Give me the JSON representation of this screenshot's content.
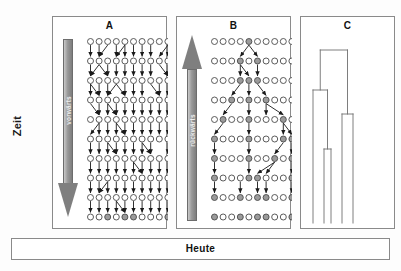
{
  "figure": {
    "time_axis_label": "Zeit",
    "bottom_bar_label": "Heute",
    "background_color": "#ffffff",
    "frame_color": "#8a8a8a"
  },
  "panels": [
    {
      "id": "A",
      "title": "A",
      "direction_label": "vorwärts",
      "direction": "down",
      "description": "Forward-in-time simulation: every individual in each generation leaves offspring links to the next generation; only some lineages survive to the present.",
      "grid": {
        "rows": 10,
        "cols": 10
      },
      "node_open_color": "#ffffff",
      "node_filled_color": "#9b9b9b",
      "node_stroke_color": "#4a4a4a",
      "filled_nodes": [
        [
          9,
          2
        ],
        [
          9,
          4
        ],
        [
          9,
          5
        ],
        [
          9,
          9
        ]
      ]
    },
    {
      "id": "B",
      "title": "B",
      "direction_label": "rückwärts",
      "direction": "up",
      "description": "Backward-in-time (coalescent) view: lineages traced from a single common ancestor at the top fan out to the present-day sample.",
      "grid": {
        "rows": 10,
        "cols": 10
      },
      "node_open_color": "#ffffff",
      "node_filled_color": "#9b9b9b",
      "node_stroke_color": "#4a4a4a",
      "filled_nodes": [
        [
          0,
          4
        ],
        [
          1,
          3
        ],
        [
          1,
          5
        ],
        [
          2,
          3
        ],
        [
          2,
          4
        ],
        [
          2,
          5
        ],
        [
          3,
          2
        ],
        [
          3,
          4
        ],
        [
          3,
          6
        ],
        [
          4,
          1
        ],
        [
          4,
          4
        ],
        [
          4,
          8
        ],
        [
          5,
          0
        ],
        [
          5,
          4
        ],
        [
          5,
          8
        ],
        [
          5,
          9
        ],
        [
          6,
          0
        ],
        [
          6,
          4
        ],
        [
          6,
          7
        ],
        [
          6,
          9
        ],
        [
          7,
          0
        ],
        [
          7,
          4
        ],
        [
          7,
          5
        ],
        [
          7,
          9
        ],
        [
          8,
          0
        ],
        [
          8,
          3
        ],
        [
          8,
          5
        ],
        [
          8,
          6
        ],
        [
          8,
          9
        ],
        [
          9,
          0
        ],
        [
          9,
          3
        ],
        [
          9,
          5
        ],
        [
          9,
          6
        ],
        [
          9,
          9
        ]
      ]
    },
    {
      "id": "C",
      "title": "C",
      "description": "Resulting genealogy drawn as a dendrogram / coalescent tree with five present-day tips.",
      "tree": {
        "tips": 5,
        "line_color": "#6f6f6f"
      }
    }
  ],
  "chart_data": {
    "type": "diagram",
    "panels": [
      "A",
      "B",
      "C"
    ],
    "axis": {
      "label": "Zeit",
      "direction": "top-to-bottom",
      "present": "Heute"
    }
  }
}
